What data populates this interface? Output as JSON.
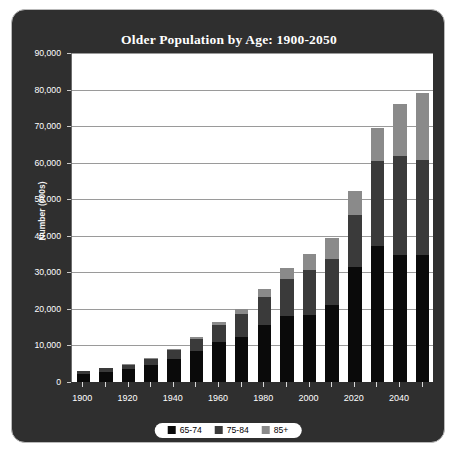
{
  "chart_data": {
    "type": "bar",
    "stacked": true,
    "title": "Older Population by Age: 1900-2050",
    "xlabel": "",
    "ylabel": "Number (000s)",
    "ylim": [
      0,
      90000
    ],
    "ytick_values": [
      0,
      10000,
      20000,
      30000,
      40000,
      50000,
      60000,
      70000,
      80000,
      90000
    ],
    "ytick_labels": [
      "0",
      "10,000",
      "20,000",
      "30,000",
      "40,000",
      "50,000",
      "60,000",
      "70,000",
      "80,000",
      "90,000"
    ],
    "grid": true,
    "legend_position": "bottom",
    "categories": [
      "1900",
      "1910",
      "1920",
      "1930",
      "1940",
      "1950",
      "1960",
      "1970",
      "1980",
      "1990",
      "2000",
      "2010",
      "2020",
      "2030",
      "2040",
      "2050"
    ],
    "xtick_labels_shown": [
      "1900",
      "1920",
      "1940",
      "1960",
      "1980",
      "2000",
      "2020",
      "2040"
    ],
    "series": [
      {
        "name": "65-74",
        "color": "#0a0a0a",
        "values": [
          2187,
          2793,
          3464,
          4721,
          6376,
          8415,
          10997,
          12447,
          15581,
          18107,
          18391,
          21057,
          31385,
          37082,
          34720,
          34843
        ]
      },
      {
        "name": "75-84",
        "color": "#3a3a3a",
        "values": [
          772,
          989,
          1259,
          1641,
          2278,
          3278,
          4633,
          6124,
          7729,
          10055,
          12361,
          12680,
          14372,
          23517,
          27188,
          25905
        ]
      },
      {
        "name": "85+",
        "color": "#8a8a8a",
        "values": [
          123,
          167,
          210,
          272,
          365,
          577,
          929,
          1409,
          2240,
          3080,
          4259,
          5671,
          6460,
          8801,
          14198,
          18223
        ]
      }
    ],
    "totals": [
      3082,
      3949,
      4933,
      6634,
      9019,
      12270,
      16559,
      19980,
      25550,
      31242,
      35011,
      39408,
      52217,
      69400,
      76106,
      78971
    ]
  },
  "legend": {
    "items": [
      {
        "label": "65-74",
        "color": "#0a0a0a"
      },
      {
        "label": "75-84",
        "color": "#3a3a3a"
      },
      {
        "label": "85+",
        "color": "#8a8a8a"
      }
    ]
  }
}
